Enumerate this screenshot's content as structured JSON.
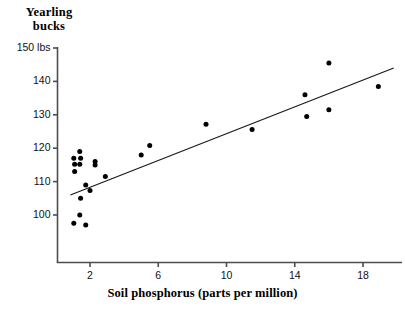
{
  "chart_data": {
    "type": "scatter",
    "title": "",
    "ylabel": "Yearling\nbucks",
    "xlabel": "Soil phosphorus (parts per million)",
    "xlim": [
      0.8,
      19.9
    ],
    "ylim": [
      93.0,
      151.5
    ],
    "grid": false,
    "legend": null,
    "xticks": [
      2,
      6,
      10,
      14,
      18
    ],
    "xtick_labels": [
      "2",
      "6",
      "10",
      "14",
      "18"
    ],
    "yticks": [
      100,
      110,
      120,
      130,
      140,
      150
    ],
    "ytick_labels": [
      "100",
      "110",
      "120",
      "130",
      "140",
      "150 lbs"
    ],
    "points": [
      {
        "x": 1.05,
        "y": 117.0
      },
      {
        "x": 1.4,
        "y": 119.0
      },
      {
        "x": 1.1,
        "y": 115.2
      },
      {
        "x": 1.45,
        "y": 117.0
      },
      {
        "x": 1.1,
        "y": 113.0
      },
      {
        "x": 1.4,
        "y": 115.2
      },
      {
        "x": 1.45,
        "y": 105.0
      },
      {
        "x": 1.4,
        "y": 100.0
      },
      {
        "x": 1.05,
        "y": 97.5
      },
      {
        "x": 1.75,
        "y": 97.0
      },
      {
        "x": 1.75,
        "y": 109.0
      },
      {
        "x": 2.0,
        "y": 107.3
      },
      {
        "x": 2.3,
        "y": 116.0
      },
      {
        "x": 2.3,
        "y": 115.0
      },
      {
        "x": 2.9,
        "y": 111.5
      },
      {
        "x": 5.0,
        "y": 118.0
      },
      {
        "x": 5.5,
        "y": 120.8
      },
      {
        "x": 8.8,
        "y": 127.2
      },
      {
        "x": 11.5,
        "y": 125.6
      },
      {
        "x": 14.6,
        "y": 136.0
      },
      {
        "x": 14.7,
        "y": 129.5
      },
      {
        "x": 16.0,
        "y": 145.5
      },
      {
        "x": 16.0,
        "y": 131.5
      },
      {
        "x": 18.9,
        "y": 138.5
      }
    ],
    "trendline": {
      "x_start": 0.85,
      "y_start": 106.0,
      "x_end": 19.8,
      "y_end": 144.0
    },
    "marker_color": "#000000",
    "line_color": "#1a1a1a",
    "axis_color": "#4d4d4d",
    "background_color": "#ffffff"
  }
}
